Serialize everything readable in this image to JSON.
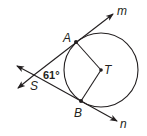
{
  "diagram": {
    "points": {
      "A": {
        "label": "A",
        "x": 76,
        "y": 42
      },
      "B": {
        "label": "B",
        "x": 81,
        "y": 101
      },
      "T": {
        "label": "T",
        "x": 101,
        "y": 70
      },
      "S": {
        "label": "S",
        "x": 34,
        "y": 75
      }
    },
    "circle": {
      "center": "T",
      "cx": 101,
      "cy": 70,
      "r": 37
    },
    "lines": {
      "m": {
        "label": "m",
        "from": "S",
        "through": "A"
      },
      "n": {
        "label": "n",
        "from": "S",
        "through": "B"
      }
    },
    "segments": [
      "TA",
      "TB"
    ],
    "angle": {
      "vertex": "S",
      "value": "61°"
    },
    "colors": {
      "stroke": "#231f20",
      "background": "#ffffff"
    }
  }
}
